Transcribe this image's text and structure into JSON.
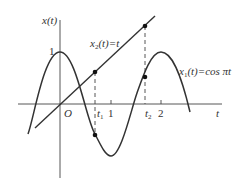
{
  "diagram": {
    "y_axis_label": "x(t)",
    "x_axis_label": "t",
    "origin_label": "O",
    "y_tick_label": "1",
    "x_ticks": [
      {
        "label": "t1",
        "display_main": "t",
        "display_sub": "1"
      },
      {
        "label": "1",
        "display_main": "1"
      },
      {
        "label": "t2",
        "display_main": "t",
        "display_sub": "2"
      },
      {
        "label": "2",
        "display_main": "2"
      }
    ],
    "curves": [
      {
        "name": "x1",
        "equation": "x1(t)=cos πt",
        "label_main": "x",
        "label_sub": "1",
        "label_rest": "(t)=cos πt"
      },
      {
        "name": "x2",
        "equation": "x2(t)=t",
        "label_main": "x",
        "label_sub": "2",
        "label_rest": "(t)=t"
      }
    ],
    "sample_points": [
      {
        "name": "x2(t1)"
      },
      {
        "name": "x1(t1)"
      },
      {
        "name": "x2(t2)"
      },
      {
        "name": "x1(t2)"
      }
    ],
    "colors": {
      "ink": "#333333",
      "background": "#ffffff"
    }
  }
}
